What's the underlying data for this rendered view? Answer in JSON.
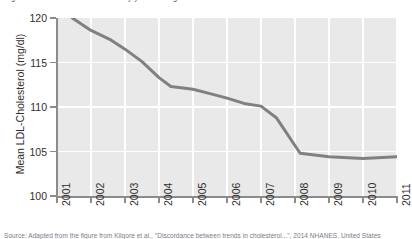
{
  "top_clipped_text": "Figure 3. Mean LDL-Cholesterol by year among adults",
  "source_note": "Source: Adapted from the figure from Kilgore et al., \"Discordance between trends in cholesterol...\", 2014 NHANES, United States",
  "chart_data": {
    "type": "line",
    "title": "",
    "xlabel": "",
    "ylabel": "Mean LDL-Cholesterol (mg/dl)",
    "xlim": [
      2001,
      2011
    ],
    "ylim": [
      100,
      120
    ],
    "grid": true,
    "legend": "none",
    "x_tick_labels": [
      "2001",
      "2002",
      "2003",
      "2004",
      "2005",
      "2006",
      "2007",
      "2008",
      "2009",
      "2010",
      "2011"
    ],
    "y_tick_labels": [
      "100",
      "105",
      "110",
      "115",
      "120"
    ],
    "y_ticks": [
      100,
      105,
      110,
      115,
      120
    ],
    "line_color": "#808080",
    "plot_background": "#e9e9e9",
    "gridline_color": "#ffffff",
    "series": [
      {
        "name": "Mean LDL-Cholesterol",
        "x": [
          2001.45,
          2002.0,
          2002.55,
          2003.0,
          2003.5,
          2004.0,
          2004.35,
          2005.0,
          2005.5,
          2006.0,
          2006.5,
          2007.0,
          2007.45,
          2008.15,
          2009.0,
          2010.0,
          2011.0
        ],
        "values": [
          120.0,
          118.6,
          117.6,
          116.5,
          115.1,
          113.3,
          112.3,
          112.0,
          111.5,
          111.0,
          110.4,
          110.1,
          108.8,
          104.8,
          104.4,
          104.2,
          104.4
        ]
      }
    ]
  }
}
